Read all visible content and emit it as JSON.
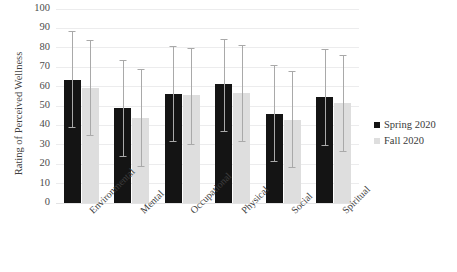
{
  "chart_data": {
    "type": "bar",
    "title": "",
    "xlabel": "",
    "ylabel": "Rating of Perceived Wellness",
    "ylim": [
      0,
      100
    ],
    "ytick_step": 10,
    "yticks": [
      100,
      90,
      80,
      70,
      60,
      50,
      40,
      30,
      20,
      10,
      0
    ],
    "grid": true,
    "legend_position": "right",
    "error_bars": "visible",
    "categories": [
      "Environmental",
      "Mental",
      "Occupational",
      "Physical",
      "Social",
      "Spiritual"
    ],
    "series": [
      {
        "name": "Spring 2020",
        "color": "#141414",
        "values": [
          63.5,
          48.8,
          56.2,
          61.2,
          45.9,
          54.8
        ],
        "error_upper": [
          88.5,
          73.5,
          81.0,
          84.5,
          71.0,
          79.5
        ],
        "error_lower": [
          38.5,
          23.5,
          31.5,
          36.5,
          21.0,
          29.5
        ]
      },
      {
        "name": "Fall 2020",
        "color": "#dedede",
        "values": [
          59.2,
          43.8,
          55.5,
          56.5,
          42.9,
          51.7
        ],
        "error_upper": [
          84.0,
          69.0,
          80.0,
          81.5,
          68.0,
          76.5
        ],
        "error_lower": [
          34.5,
          18.5,
          30.0,
          31.5,
          18.0,
          26.5
        ]
      }
    ]
  },
  "legend": {
    "entries": [
      {
        "label": "Spring 2020",
        "color": "#141414"
      },
      {
        "label": "Fall 2020",
        "color": "#dedede"
      }
    ]
  },
  "axes": {
    "y_title": "Rating of Perceived Wellness"
  },
  "top_strip": {
    "text": ""
  }
}
